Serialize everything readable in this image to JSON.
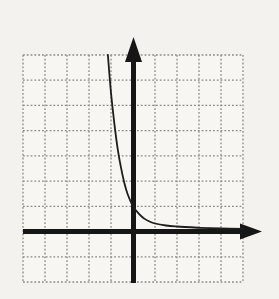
{
  "label": {
    "text": "3."
  },
  "colors": {
    "background": "#f3f2ee",
    "paper": "#f7f6f2",
    "grid_line": "#8b8a86",
    "axis": "#161616",
    "curve": "#1d1d1d",
    "label": "#1c1c1c"
  },
  "chart_data": {
    "type": "line",
    "title": "",
    "xlabel": "",
    "ylabel": "",
    "grid": "on",
    "x_range": [
      -5,
      5
    ],
    "y_range": [
      -2,
      7
    ],
    "grid_columns": 10,
    "grid_rows": 9,
    "axes": {
      "y_axis_column": 5,
      "x_axis_row": 7,
      "x_arrow": "right",
      "y_arrow": "up",
      "tick_labels": "none"
    },
    "series": [
      {
        "name": "exponential-decay-curve",
        "points": [
          [
            -1.14,
            7.0
          ],
          [
            -1.0,
            5.5
          ],
          [
            -0.85,
            4.3
          ],
          [
            -0.7,
            3.3
          ],
          [
            -0.55,
            2.55
          ],
          [
            -0.4,
            1.95
          ],
          [
            -0.25,
            1.5
          ],
          [
            0,
            1.0
          ],
          [
            0.25,
            0.72
          ],
          [
            0.5,
            0.52
          ],
          [
            0.75,
            0.4
          ],
          [
            1.0,
            0.32
          ],
          [
            1.5,
            0.24
          ],
          [
            2.0,
            0.2
          ],
          [
            3.0,
            0.15
          ],
          [
            4.0,
            0.12
          ],
          [
            5.0,
            0.1
          ]
        ]
      }
    ]
  }
}
